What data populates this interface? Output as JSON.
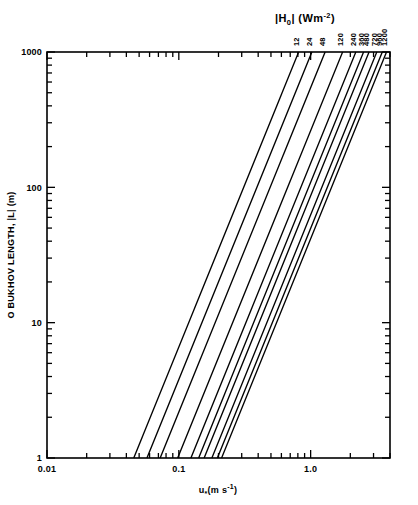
{
  "chart_data": {
    "type": "line",
    "xlabel": "u∗(m s⁻¹)",
    "ylabel": "O BUKHOV LENGTH, |L| (m)",
    "xscale": "log",
    "yscale": "log",
    "xlim": [
      0.01,
      4.0
    ],
    "ylim": [
      1,
      1000
    ],
    "grid": false,
    "legend_position": "curve-end-labels-top",
    "xticklabels": [
      "0.01",
      "0.1",
      "1.0"
    ],
    "xtickvalues": [
      0.01,
      0.1,
      1.0
    ],
    "yticklabels": [
      "1",
      "10",
      "100",
      "1000"
    ],
    "ytickvalues": [
      1,
      10,
      100,
      1000
    ],
    "series_param_name": "|H₀|",
    "series_param_unit": "Wm⁻²",
    "series": [
      {
        "name": "12",
        "value": 12,
        "x_at_L1": 0.0455,
        "x_at_L1000": 0.811
      },
      {
        "name": "24",
        "value": 24,
        "x_at_L1": 0.0573,
        "x_at_L1000": 1.022
      },
      {
        "name": "48",
        "value": 48,
        "x_at_L1": 0.0722,
        "x_at_L1000": 1.288
      },
      {
        "name": "120",
        "value": 120,
        "x_at_L1": 0.098,
        "x_at_L1000": 1.748
      },
      {
        "name": "240",
        "value": 240,
        "x_at_L1": 0.1235,
        "x_at_L1000": 2.202
      },
      {
        "name": "360",
        "value": 360,
        "x_at_L1": 0.1414,
        "x_at_L1000": 2.521
      },
      {
        "name": "480",
        "value": 480,
        "x_at_L1": 0.1556,
        "x_at_L1000": 2.774
      },
      {
        "name": "720",
        "value": 720,
        "x_at_L1": 0.1781,
        "x_at_L1000": 3.176
      },
      {
        "name": "960",
        "value": 960,
        "x_at_L1": 0.196,
        "x_at_L1000": 3.495
      },
      {
        "name": "1200",
        "value": 1200,
        "x_at_L1": 0.2111,
        "x_at_L1000": 3.764
      }
    ]
  },
  "colors": {
    "ink": "#000000",
    "background": "#ffffff"
  }
}
